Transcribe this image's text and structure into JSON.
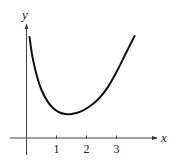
{
  "chart_data": {
    "type": "line",
    "title": "",
    "xlabel": "x",
    "ylabel": "y",
    "x_ticks": [
      "1",
      "2",
      "3"
    ],
    "y_ticks": [],
    "grid": false,
    "legend": null,
    "xlim": [
      -0.5,
      4.5
    ],
    "ylim": [
      -0.6,
      3.8
    ],
    "series": [
      {
        "name": "curve",
        "x": [
          0.1,
          0.2,
          0.35,
          0.5,
          0.7,
          0.9,
          1.1,
          1.3,
          1.5,
          1.8,
          2.1,
          2.4,
          2.7,
          3.0,
          3.3,
          3.6
        ],
        "y": [
          3.37,
          2.7,
          2.05,
          1.6,
          1.22,
          0.98,
          0.85,
          0.8,
          0.8,
          0.88,
          1.05,
          1.3,
          1.68,
          2.2,
          2.8,
          3.4
        ]
      }
    ]
  },
  "axes": {
    "x_label": "x",
    "y_label": "y",
    "tick_labels": [
      "1",
      "2",
      "3"
    ]
  }
}
